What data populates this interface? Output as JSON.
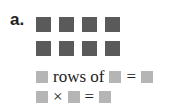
{
  "problem": {
    "label": "a.",
    "array": {
      "rows": 2,
      "columns": 4
    },
    "line1": {
      "text_rows_of": "rows of",
      "equals": "="
    },
    "line2": {
      "times": "×",
      "equals": "="
    }
  },
  "colors": {
    "square": "#5a5a5a",
    "answer_box": "#b5b5b5"
  }
}
